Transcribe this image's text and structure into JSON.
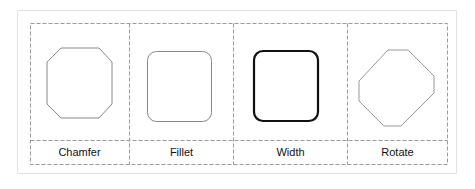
{
  "columns": [
    {
      "label": "Chamfer",
      "shape": "chamfered-square"
    },
    {
      "label": "Fillet",
      "shape": "rounded-square"
    },
    {
      "label": "Width",
      "shape": "thick-rounded-square"
    },
    {
      "label": "Rotate",
      "shape": "octagon"
    }
  ],
  "colors": {
    "dashed_border": "#9a9a9a",
    "thin_stroke": "#888888",
    "thick_stroke": "#111111",
    "outer_border": "#e2e2e2"
  }
}
